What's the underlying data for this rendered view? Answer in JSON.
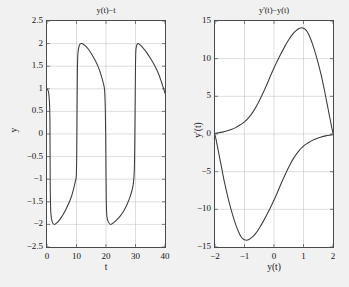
{
  "figure": {
    "background_color": "#f1f1f1",
    "axes_color": "#4a4a4a",
    "curve_color": "#3a3a3a",
    "grid_color": "#bdbdbd"
  },
  "chart_data": [
    {
      "type": "line",
      "name": "time-series",
      "title": "y(t)−t",
      "xlabel": "t",
      "ylabel": "y",
      "xlim": [
        0,
        40
      ],
      "ylim": [
        -2.5,
        2.5
      ],
      "xticks": [
        0,
        10,
        20,
        30,
        40
      ],
      "xtick_labels": [
        "0",
        "10",
        "20",
        "30",
        "40"
      ],
      "yticks": [
        -2.5,
        -2,
        -1.5,
        -1,
        -0.5,
        0,
        0.5,
        1,
        1.5,
        2,
        2.5
      ],
      "ytick_labels": [
        "−2.5",
        "−2",
        "−1.5",
        "−1",
        "−0.5",
        "0",
        "0.5",
        "1",
        "1.5",
        "2",
        "2.5"
      ],
      "grid": true,
      "legend": null,
      "description": "Van der Pol relaxation oscillation: slow decay from +2 to -2 type ramps separated by near-vertical fast jumps; period about 19.5 time units.",
      "series": [
        {
          "name": "y(t)",
          "x": [
            0,
            0.3,
            0.6,
            0.9,
            1.0,
            1.05,
            1.1,
            1.3,
            1.8,
            2.6,
            3.6,
            4.8,
            6.0,
            7.2,
            8.2,
            9.0,
            9.6,
            9.95,
            10.1,
            10.2,
            10.3,
            10.5,
            11.0,
            11.8,
            12.8,
            14.0,
            15.2,
            16.4,
            17.4,
            18.2,
            19.0,
            19.5,
            19.75,
            19.9,
            20.0,
            20.1,
            20.3,
            20.8,
            21.6,
            22.6,
            23.8,
            25.0,
            26.2,
            27.2,
            28.0,
            28.8,
            29.3,
            29.6,
            29.75,
            29.9,
            30.0,
            30.1,
            30.3,
            30.8,
            31.6,
            32.6,
            33.8,
            35.0,
            36.2,
            37.2,
            38.0,
            38.8,
            39.3,
            39.7,
            40
          ],
          "y": [
            1.0,
            0.97,
            0.9,
            0.6,
            0.2,
            -0.5,
            -1.2,
            -1.75,
            -1.95,
            -2.0,
            -1.95,
            -1.85,
            -1.72,
            -1.56,
            -1.4,
            -1.22,
            -1.05,
            -0.9,
            -0.3,
            0.6,
            1.4,
            1.8,
            1.97,
            2.0,
            1.96,
            1.88,
            1.76,
            1.62,
            1.48,
            1.33,
            1.15,
            0.98,
            0.6,
            0.0,
            -0.9,
            -1.5,
            -1.82,
            -1.95,
            -2.0,
            -1.96,
            -1.89,
            -1.8,
            -1.68,
            -1.55,
            -1.42,
            -1.25,
            -1.08,
            -0.8,
            -0.2,
            0.8,
            1.5,
            1.82,
            1.94,
            2.0,
            1.97,
            1.9,
            1.8,
            1.68,
            1.55,
            1.42,
            1.3,
            1.15,
            1.05,
            0.97,
            0.9
          ]
        }
      ]
    },
    {
      "type": "line",
      "name": "phase-portrait",
      "title": "y'(t)−y(t)",
      "xlabel": "y(t)",
      "ylabel": "y'(t)",
      "xlim": [
        -2,
        2
      ],
      "ylim": [
        -15,
        15
      ],
      "xticks": [
        -2,
        -1,
        0,
        1,
        2
      ],
      "xtick_labels": [
        "−2",
        "−1",
        "0",
        "1",
        "2"
      ],
      "yticks": [
        -15,
        -10,
        -5,
        0,
        5,
        10,
        15
      ],
      "ytick_labels": [
        "−15",
        "−10",
        "−5",
        "0",
        "5",
        "10",
        "15"
      ],
      "grid": true,
      "legend": null,
      "description": "Closed limit cycle of the Van der Pol oscillator. Upper branch rises from near 0 at y=-2 to a peak of about 14 near y=1 then falls to 0 at y=2. Lower branch is the point reflection: drops from 0 at y=2 to a minimum of about -14 near y=-1 and returns to 0 at y=-2.",
      "series": [
        {
          "name": "upper-branch",
          "x": [
            -2.0,
            -1.9,
            -1.75,
            -1.6,
            -1.45,
            -1.3,
            -1.15,
            -1.0,
            -0.85,
            -0.7,
            -0.55,
            -0.4,
            -0.25,
            -0.1,
            0.05,
            0.2,
            0.35,
            0.5,
            0.62,
            0.74,
            0.85,
            0.94,
            1.0,
            1.06,
            1.12,
            1.2,
            1.3,
            1.42,
            1.55,
            1.68,
            1.8,
            1.9,
            1.96,
            2.0
          ],
          "y": [
            0.1,
            0.15,
            0.25,
            0.4,
            0.6,
            0.85,
            1.2,
            1.6,
            2.2,
            3.0,
            4.0,
            5.2,
            6.5,
            7.9,
            9.2,
            10.4,
            11.5,
            12.5,
            13.2,
            13.7,
            14.0,
            14.1,
            14.05,
            13.9,
            13.6,
            13.0,
            12.0,
            10.5,
            8.6,
            6.4,
            4.0,
            2.0,
            0.8,
            0.1
          ]
        },
        {
          "name": "lower-branch",
          "x": [
            2.0,
            1.9,
            1.75,
            1.6,
            1.45,
            1.3,
            1.15,
            1.0,
            0.85,
            0.7,
            0.55,
            0.4,
            0.25,
            0.1,
            -0.05,
            -0.2,
            -0.35,
            -0.5,
            -0.62,
            -0.74,
            -0.85,
            -0.94,
            -1.0,
            -1.06,
            -1.12,
            -1.2,
            -1.3,
            -1.42,
            -1.55,
            -1.68,
            -1.8,
            -1.9,
            -1.96,
            -2.0
          ],
          "y": [
            -0.1,
            -0.15,
            -0.25,
            -0.4,
            -0.6,
            -0.85,
            -1.2,
            -1.6,
            -2.2,
            -3.0,
            -4.0,
            -5.2,
            -6.5,
            -7.9,
            -9.2,
            -10.4,
            -11.5,
            -12.5,
            -13.2,
            -13.7,
            -14.0,
            -14.1,
            -14.05,
            -13.9,
            -13.6,
            -13.0,
            -12.0,
            -10.5,
            -8.6,
            -6.4,
            -4.0,
            -2.0,
            -0.8,
            -0.1
          ]
        }
      ]
    }
  ]
}
